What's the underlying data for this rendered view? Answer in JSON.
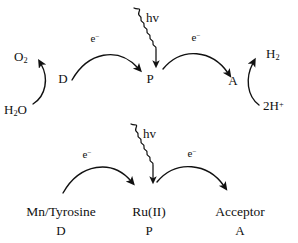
{
  "figure": {
    "background_color": "#ffffff",
    "stroke_color": "#111111",
    "width": 298,
    "height": 243
  },
  "top_scheme": {
    "name": "abstract-scheme",
    "oxygen": "O",
    "oxygen_sub": "2",
    "water": "H",
    "water_sub": "2",
    "water_tail": "O",
    "donor": "D",
    "photosensitizer": "P",
    "acceptor": "A",
    "hydrogen": "H",
    "hydrogen_sub": "2",
    "proton_count": "2H",
    "proton_charge": "+",
    "electron_left": "e",
    "electron_left_charge": "−",
    "electron_right": "e",
    "electron_right_charge": "−",
    "photon": "hv"
  },
  "bottom_scheme": {
    "name": "molecular-scheme",
    "donor_compound": "Mn/Tyrosine",
    "donor_role": "D",
    "photosensitizer_compound": "Ru(II)",
    "photosensitizer_role": "P",
    "acceptor_compound": "Acceptor",
    "acceptor_role": "A",
    "electron_left": "e",
    "electron_left_charge": "−",
    "electron_right": "e",
    "electron_right_charge": "−",
    "photon": "hv"
  }
}
